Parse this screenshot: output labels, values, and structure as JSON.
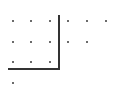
{
  "diagram": {
    "type": "dot-grid",
    "colors": {
      "dot": "#3a3a3a",
      "line": "#333333",
      "background": "#ffffff"
    },
    "dots": [
      {
        "x": 13,
        "y": 21
      },
      {
        "x": 31,
        "y": 21
      },
      {
        "x": 50,
        "y": 21
      },
      {
        "x": 68,
        "y": 21
      },
      {
        "x": 87,
        "y": 21
      },
      {
        "x": 106,
        "y": 21
      },
      {
        "x": 13,
        "y": 42
      },
      {
        "x": 31,
        "y": 42
      },
      {
        "x": 50,
        "y": 42
      },
      {
        "x": 68,
        "y": 42
      },
      {
        "x": 87,
        "y": 42
      },
      {
        "x": 13,
        "y": 62
      },
      {
        "x": 31,
        "y": 62
      },
      {
        "x": 50,
        "y": 62
      },
      {
        "x": 13,
        "y": 83
      }
    ],
    "row_counts": [
      6,
      5,
      3,
      1
    ],
    "lines": [
      {
        "kind": "vertical",
        "x": 59,
        "y1": 15,
        "y2": 70
      },
      {
        "kind": "horizontal",
        "y": 69,
        "x1": 8,
        "x2": 60
      }
    ]
  }
}
